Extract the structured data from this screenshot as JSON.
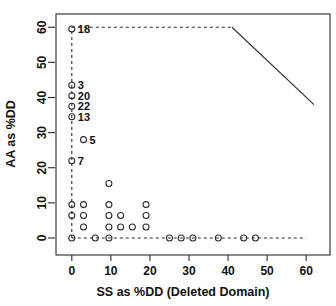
{
  "chart_data": {
    "type": "scatter",
    "title": "",
    "xlabel": "SS as %DD (Deleted Domain)",
    "ylabel": "AA as %DD",
    "xlim": [
      -2,
      62
    ],
    "ylim": [
      -2,
      61.5
    ],
    "xticks": [
      0,
      10,
      20,
      30,
      40,
      50,
      60
    ],
    "yticks": [
      0,
      10,
      20,
      30,
      40,
      50,
      60
    ],
    "xtick_labels": [
      "0",
      "10",
      "20",
      "30",
      "40",
      "50",
      "60"
    ],
    "ytick_labels": [
      "0",
      "10",
      "20",
      "30",
      "40",
      "50",
      "60"
    ],
    "grid": false,
    "legend": "none",
    "points": [
      {
        "x": 0,
        "y": 59.5,
        "label": "18"
      },
      {
        "x": 0,
        "y": 43.5,
        "label": "3"
      },
      {
        "x": 0,
        "y": 40.5,
        "label": "20"
      },
      {
        "x": 0,
        "y": 37.5,
        "label": "22"
      },
      {
        "x": 0,
        "y": 34.5,
        "label": "13"
      },
      {
        "x": 3.0,
        "y": 28.0,
        "label": "5"
      },
      {
        "x": 0,
        "y": 22.0,
        "label": "7"
      },
      {
        "x": 9.5,
        "y": 15.5,
        "label": ""
      },
      {
        "x": 0,
        "y": 9.5,
        "label": ""
      },
      {
        "x": 3.0,
        "y": 9.5,
        "label": ""
      },
      {
        "x": 9.5,
        "y": 9.5,
        "label": ""
      },
      {
        "x": 19.0,
        "y": 9.5,
        "label": ""
      },
      {
        "x": 0,
        "y": 6.4,
        "label": ""
      },
      {
        "x": 3.0,
        "y": 6.4,
        "label": ""
      },
      {
        "x": 9.5,
        "y": 6.4,
        "label": ""
      },
      {
        "x": 12.5,
        "y": 6.4,
        "label": ""
      },
      {
        "x": 19.0,
        "y": 6.4,
        "label": ""
      },
      {
        "x": 3.0,
        "y": 3.1,
        "label": ""
      },
      {
        "x": 9.5,
        "y": 3.1,
        "label": ""
      },
      {
        "x": 12.5,
        "y": 3.1,
        "label": ""
      },
      {
        "x": 15.5,
        "y": 3.1,
        "label": ""
      },
      {
        "x": 19.0,
        "y": 3.1,
        "label": ""
      },
      {
        "x": 0,
        "y": 0,
        "label": ""
      },
      {
        "x": 6.0,
        "y": 0,
        "label": ""
      },
      {
        "x": 9.5,
        "y": 0,
        "label": ""
      },
      {
        "x": 25.0,
        "y": 0,
        "label": ""
      },
      {
        "x": 28.0,
        "y": 0,
        "label": ""
      },
      {
        "x": 31.0,
        "y": 0,
        "label": ""
      },
      {
        "x": 37.5,
        "y": 0,
        "label": ""
      },
      {
        "x": 44.0,
        "y": 0,
        "label": ""
      },
      {
        "x": 47.0,
        "y": 0,
        "label": ""
      }
    ],
    "reference_lines": [
      {
        "name": "vertical-dashed-at-x0",
        "style": "dashed",
        "x1": 0,
        "y1": 0,
        "x2": 0,
        "y2": 60
      },
      {
        "name": "horizontal-dashed-at-y0",
        "style": "dashed",
        "x1": 0,
        "y1": 0,
        "x2": 60,
        "y2": 0
      },
      {
        "name": "horizontal-dashed-at-y60",
        "style": "dashed",
        "x1": 0,
        "y1": 60,
        "x2": 41,
        "y2": 60
      },
      {
        "name": "upper-bound-diagonal",
        "style": "solid",
        "x1": 41,
        "y1": 60,
        "x2": 62,
        "y2": 38
      }
    ],
    "marker": {
      "shape": "circle-open",
      "color": "#2b2b2b",
      "radius": 3
    }
  }
}
